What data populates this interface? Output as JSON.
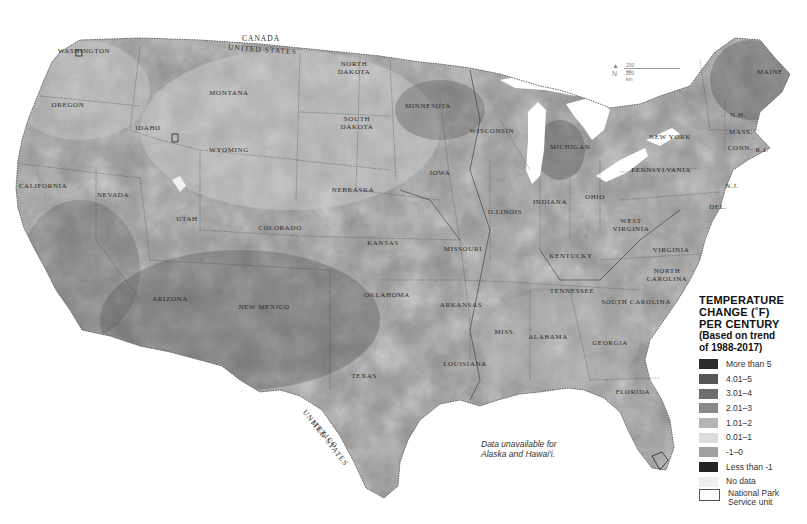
{
  "map": {
    "title_lines": [
      "TEMPERATURE",
      "CHANGE (˚F)",
      "PER CENTURY"
    ],
    "subtitle_lines": [
      "(Based on trend",
      "of 1988-2017)"
    ],
    "note": [
      "Data unavailable for",
      "Alaska and Hawai'i."
    ],
    "scale": {
      "miles": "200 mi",
      "km": "200 km",
      "north": "N"
    },
    "border_labels": {
      "canada": "CANADA",
      "us_north": "UNITED STATES",
      "us_south": "UNITED STATES",
      "mexico": "MEXICO"
    },
    "legend": [
      {
        "label": "More than 5",
        "color": "#2b2b2b"
      },
      {
        "label": "4.01–5",
        "color": "#555555"
      },
      {
        "label": "3.01–4",
        "color": "#6e6e6e"
      },
      {
        "label": "2.01–3",
        "color": "#8a8a8a"
      },
      {
        "label": "1.01–2",
        "color": "#b4b4b4"
      },
      {
        "label": "0.01–1",
        "color": "#dcdcdc"
      },
      {
        "label": "-1–0",
        "color": "#a0a0a0"
      },
      {
        "label": "Less than -1",
        "color": "#252525"
      },
      {
        "label": "No data",
        "color": "#eeeeee"
      },
      {
        "label": "National Park\nService unit",
        "color": "#ffffff",
        "outline": true
      }
    ],
    "states": [
      {
        "name": "WASHINGTON",
        "x": 84,
        "y": 51
      },
      {
        "name": "OREGON",
        "x": 68,
        "y": 105
      },
      {
        "name": "IDAHO",
        "x": 148,
        "y": 128
      },
      {
        "name": "MONTANA",
        "x": 229,
        "y": 93
      },
      {
        "name": "WYOMING",
        "x": 229,
        "y": 150
      },
      {
        "name": "NORTH\nDAKOTA",
        "x": 354,
        "y": 68
      },
      {
        "name": "SOUTH\nDAKOTA",
        "x": 357,
        "y": 123
      },
      {
        "name": "MINNESOTA",
        "x": 428,
        "y": 106
      },
      {
        "name": "WISCONSIN",
        "x": 492,
        "y": 131
      },
      {
        "name": "MICHIGAN",
        "x": 570,
        "y": 147
      },
      {
        "name": "NEW YORK",
        "x": 670,
        "y": 137
      },
      {
        "name": "MAINE",
        "x": 770,
        "y": 72
      },
      {
        "name": "N.H.",
        "x": 738,
        "y": 115
      },
      {
        "name": "MASS.",
        "x": 741,
        "y": 132
      },
      {
        "name": "CONN.",
        "x": 740,
        "y": 148
      },
      {
        "name": "R.I.",
        "x": 762,
        "y": 150
      },
      {
        "name": "N.J.",
        "x": 732,
        "y": 186
      },
      {
        "name": "DEL.",
        "x": 718,
        "y": 207
      },
      {
        "name": "PENNSYLVANIA",
        "x": 661,
        "y": 170
      },
      {
        "name": "OHIO",
        "x": 595,
        "y": 197
      },
      {
        "name": "INDIANA",
        "x": 550,
        "y": 202
      },
      {
        "name": "ILLINOIS",
        "x": 505,
        "y": 212
      },
      {
        "name": "IOWA",
        "x": 440,
        "y": 173
      },
      {
        "name": "NEBRASKA",
        "x": 353,
        "y": 190
      },
      {
        "name": "CALIFORNIA",
        "x": 43,
        "y": 186
      },
      {
        "name": "NEVADA",
        "x": 113,
        "y": 195
      },
      {
        "name": "UTAH",
        "x": 187,
        "y": 219
      },
      {
        "name": "COLORADO",
        "x": 280,
        "y": 228
      },
      {
        "name": "KANSAS",
        "x": 383,
        "y": 243
      },
      {
        "name": "MISSOURI",
        "x": 463,
        "y": 249
      },
      {
        "name": "KENTUCKY",
        "x": 571,
        "y": 256
      },
      {
        "name": "WEST\nVIRGINIA",
        "x": 631,
        "y": 225
      },
      {
        "name": "VIRGINIA",
        "x": 671,
        "y": 250
      },
      {
        "name": "NORTH\nCAROLINA",
        "x": 667,
        "y": 275
      },
      {
        "name": "TENNESSEE",
        "x": 572,
        "y": 291
      },
      {
        "name": "SOUTH CAROLINA",
        "x": 636,
        "y": 302
      },
      {
        "name": "ARIZONA",
        "x": 170,
        "y": 299
      },
      {
        "name": "NEW MEXICO",
        "x": 264,
        "y": 307
      },
      {
        "name": "OKLAHOMA",
        "x": 387,
        "y": 295
      },
      {
        "name": "ARKANSAS",
        "x": 461,
        "y": 305
      },
      {
        "name": "MISS.",
        "x": 505,
        "y": 332
      },
      {
        "name": "ALABAMA",
        "x": 548,
        "y": 337
      },
      {
        "name": "GEORGIA",
        "x": 610,
        "y": 343
      },
      {
        "name": "LOUISIANA",
        "x": 465,
        "y": 364
      },
      {
        "name": "TEXAS",
        "x": 364,
        "y": 376
      },
      {
        "name": "FLORIDA",
        "x": 633,
        "y": 392
      }
    ]
  }
}
